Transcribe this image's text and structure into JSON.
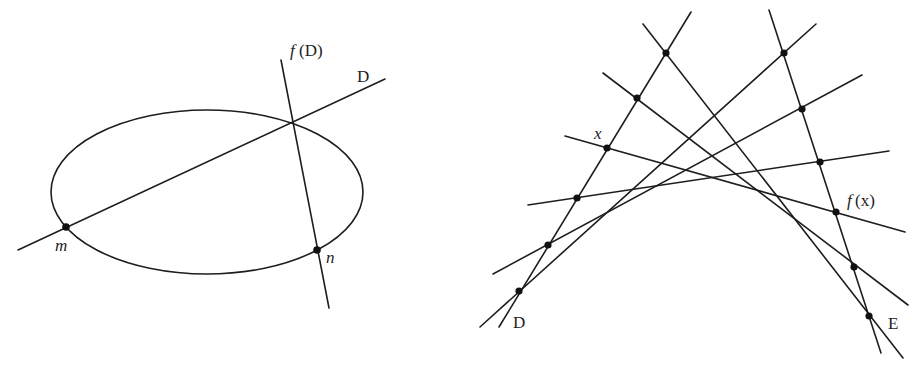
{
  "figure_left": {
    "labels": {
      "line_d": "D",
      "line_fd_f": "f",
      "line_fd_arg": "(D)",
      "point_m": "m",
      "point_n": "n"
    },
    "ellipse": {
      "cx": 207,
      "cy": 192,
      "rx": 156,
      "ry": 82
    },
    "line_d": {
      "x1": 18,
      "y1": 250,
      "x2": 385,
      "y2": 79
    },
    "line_fd": {
      "x1": 281,
      "y1": 60,
      "x2": 329,
      "y2": 308
    },
    "points": [
      {
        "name": "m",
        "x": 66,
        "y": 227
      },
      {
        "name": "n",
        "x": 317,
        "y": 250
      }
    ]
  },
  "figure_right": {
    "labels": {
      "line_d": "D",
      "line_e": "E",
      "point_x": "x",
      "point_fx_f": "f",
      "point_fx_arg": "(x)"
    },
    "line_d": {
      "x1": 691,
      "y1": 12,
      "x2": 499,
      "y2": 327
    },
    "line_e": {
      "x1": 769,
      "y1": 10,
      "x2": 881,
      "y2": 353
    },
    "points_on_d": [
      {
        "x": 666,
        "y": 53
      },
      {
        "x": 637,
        "y": 98
      },
      {
        "x": 607,
        "y": 148
      },
      {
        "x": 577,
        "y": 198
      },
      {
        "x": 548,
        "y": 245
      },
      {
        "x": 519,
        "y": 291
      }
    ],
    "points_on_e": [
      {
        "x": 784,
        "y": 53
      },
      {
        "x": 802,
        "y": 109
      },
      {
        "x": 820,
        "y": 162
      },
      {
        "x": 836,
        "y": 212
      },
      {
        "x": 854,
        "y": 267
      },
      {
        "x": 869,
        "y": 316
      }
    ],
    "connecting_lines": [
      {
        "x1": 643,
        "y1": 24,
        "x2": 903,
        "y2": 358
      },
      {
        "x1": 603,
        "y1": 73,
        "x2": 908,
        "y2": 305
      },
      {
        "x1": 565,
        "y1": 136,
        "x2": 905,
        "y2": 232
      },
      {
        "x1": 528,
        "y1": 205,
        "x2": 889,
        "y2": 151
      },
      {
        "x1": 493,
        "y1": 274,
        "x2": 862,
        "y2": 75
      },
      {
        "x1": 480,
        "y1": 327,
        "x2": 816,
        "y2": 24
      }
    ]
  }
}
